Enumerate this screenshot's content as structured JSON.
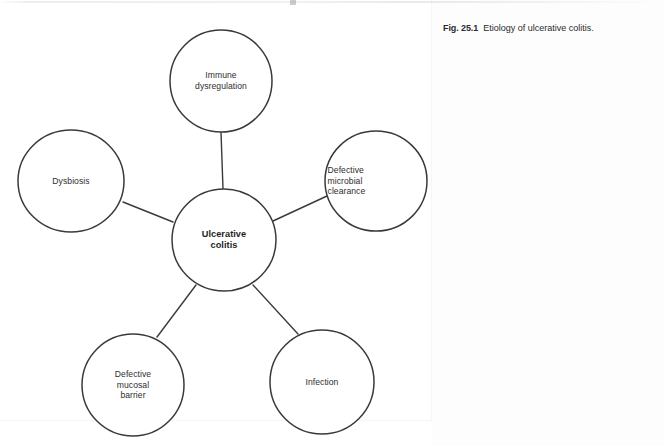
{
  "figure": {
    "caption_number": "Fig. 25.1",
    "caption_text": "Etiology of ulcerative colitis."
  },
  "diagram": {
    "type": "radial-concept-map",
    "stroke_color": "#3a3a3a",
    "text_color": "#2e2e2e",
    "background_color": "#ffffff",
    "center_node": {
      "id": "ulcerative-colitis",
      "label": "Ulcerative\ncolitis",
      "bold": true,
      "cx": 224,
      "cy": 240,
      "rx": 52,
      "ry": 51
    },
    "satellite_nodes": [
      {
        "id": "immune-dysregulation",
        "label": "Immune\ndysregulation",
        "cx": 221,
        "cy": 81,
        "rx": 51,
        "ry": 51,
        "align": "center",
        "position": "top"
      },
      {
        "id": "dysbiosis",
        "label": "Dysbiosis",
        "cx": 71,
        "cy": 181,
        "rx": 53,
        "ry": 51,
        "align": "center",
        "position": "left"
      },
      {
        "id": "defective-microbial-clearance",
        "label": "Defective\nmicrobial\nclearance",
        "cx": 376,
        "cy": 181,
        "rx": 51,
        "ry": 50,
        "align": "left",
        "position": "right"
      },
      {
        "id": "defective-mucosal-barrier",
        "label": "Defective\nmucosal\nbarrier",
        "cx": 133,
        "cy": 385,
        "rx": 51,
        "ry": 51,
        "align": "center",
        "position": "bottom-left"
      },
      {
        "id": "infection",
        "label": "Infection",
        "cx": 322,
        "cy": 382,
        "rx": 52,
        "ry": 52,
        "align": "center",
        "position": "bottom-right"
      }
    ],
    "connectors": [
      {
        "id": "connector-center-immune",
        "from": "ulcerative-colitis",
        "to": "immune-dysregulation",
        "x1": 223,
        "y1": 189,
        "x2": 221,
        "y2": 132
      },
      {
        "id": "connector-center-dysbiosis",
        "from": "ulcerative-colitis",
        "to": "dysbiosis",
        "x1": 173,
        "y1": 222,
        "x2": 123,
        "y2": 202
      },
      {
        "id": "connector-center-clearance",
        "from": "ulcerative-colitis",
        "to": "defective-microbial-clearance",
        "x1": 273,
        "y1": 221,
        "x2": 327,
        "y2": 196
      },
      {
        "id": "connector-center-barrier",
        "from": "ulcerative-colitis",
        "to": "defective-mucosal-barrier",
        "x1": 196,
        "y1": 285,
        "x2": 157,
        "y2": 337
      },
      {
        "id": "connector-center-infection",
        "from": "ulcerative-colitis",
        "to": "infection",
        "x1": 253,
        "y1": 285,
        "x2": 298,
        "y2": 334
      }
    ]
  }
}
